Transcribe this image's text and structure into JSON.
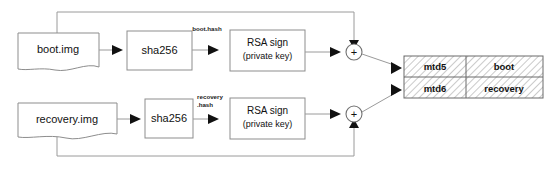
{
  "diagram": {
    "background_color": "#ffffff",
    "line_color": "#9a9a9a",
    "text_color": "#111111",
    "hatch_color": "#b8b8b8",
    "nodes": {
      "boot_img": {
        "label": "boot.img",
        "shape": "document"
      },
      "recovery_img": {
        "label": "recovery.img",
        "shape": "document"
      },
      "sha256_boot": {
        "label": "sha256",
        "shape": "rectangle"
      },
      "sha256_recovery": {
        "label": "sha256",
        "shape": "rectangle"
      },
      "rsa_boot": {
        "line1": "RSA sign",
        "line2": "(private key)",
        "shape": "rectangle"
      },
      "rsa_recovery": {
        "line1": "RSA sign",
        "line2": "(private key)",
        "shape": "rectangle"
      },
      "adder_boot": {
        "label": "+",
        "shape": "circle"
      },
      "adder_recovery": {
        "label": "+",
        "shape": "circle"
      }
    },
    "edge_labels": {
      "boot_hash": "boot.hash",
      "recovery_hash_line1": "recovery",
      "recovery_hash_line2": ".hash"
    },
    "partition_table": {
      "rows": [
        {
          "device": "mtd5",
          "name": "boot"
        },
        {
          "device": "mtd6",
          "name": "recovery"
        }
      ]
    }
  }
}
